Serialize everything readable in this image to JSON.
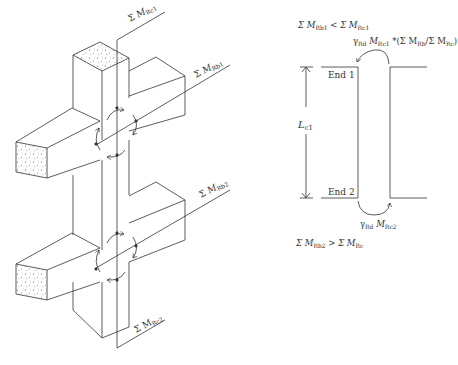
{
  "left_figure": {
    "labels": {
      "mrc1": {
        "prefix": "Σ",
        "var": "M",
        "sub": "Rc1"
      },
      "mrb1": {
        "prefix": "Σ",
        "var": "M",
        "sub": "Rb1"
      },
      "mrb2": {
        "prefix": "Σ",
        "var": "M",
        "sub": "Rb2"
      },
      "mrc2": {
        "prefix": "Σ",
        "var": "M",
        "sub": "Rc2"
      }
    }
  },
  "right_figure": {
    "condition_top": {
      "lhs_var": "Σ M",
      "lhs_sub": "Rb1",
      "op": " < Σ M",
      "rhs_sub": "Rc1"
    },
    "moment_top": {
      "gamma": "γ",
      "gamma_sub": "Rd",
      "var": " M",
      "var_sub": "Rc1",
      "factor": " *(Σ M",
      "f_sub1": "Rb",
      "f_mid": "/Σ M",
      "f_sub2": "Rc",
      "f_end": ")"
    },
    "end1_label": "End 1",
    "end2_label": "End 2",
    "length_label": {
      "var": "L",
      "sub": "c1"
    },
    "moment_bottom": {
      "gamma": "γ",
      "gamma_sub": "Rd",
      "var": " M",
      "var_sub": "Rc2"
    },
    "condition_bottom": {
      "lhs_var": "Σ M",
      "lhs_sub": "Rb2",
      "op": " > Σ M",
      "rhs_sub": "Rc"
    }
  }
}
